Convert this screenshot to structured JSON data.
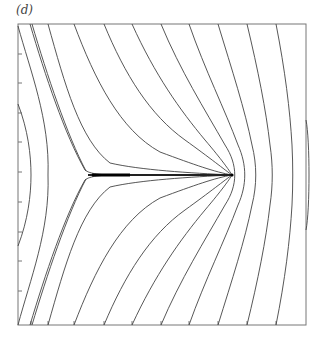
{
  "figure": {
    "panel_label": "(d)",
    "frame": {
      "left": 18,
      "top": 24,
      "right": 306,
      "bottom": 325
    },
    "axis_ticks": {
      "left_y": [
        54,
        83,
        113,
        142,
        172,
        202,
        232,
        261,
        291
      ],
      "bottom_x": [
        31,
        48,
        74,
        104,
        132,
        161,
        189,
        218,
        247,
        276
      ]
    },
    "features": {
      "cusp_point": [
        88,
        175
      ],
      "sink_point": [
        232,
        175
      ],
      "centerline_y": 175
    },
    "colors": {
      "line": "#444444",
      "frame": "#777777",
      "background": "#ffffff"
    }
  }
}
